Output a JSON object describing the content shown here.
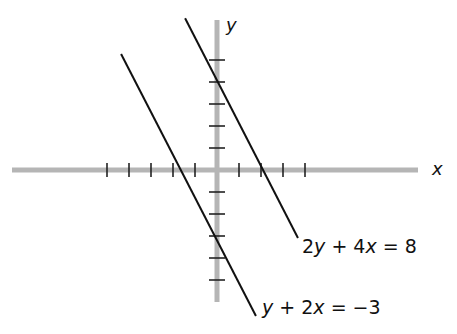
{
  "chart_data": {
    "type": "line",
    "title": "",
    "xlabel": "x",
    "ylabel": "y",
    "xlim": [
      -9.3,
      9.2
    ],
    "ylim": [
      -6.0,
      6.8
    ],
    "grid": false,
    "x_ticks": [
      -5,
      -4,
      -3,
      -2,
      -1,
      1,
      2,
      3,
      4
    ],
    "y_ticks": [
      -5,
      -4,
      -3,
      -2,
      -1,
      1,
      2,
      3,
      4,
      5
    ],
    "series": [
      {
        "name": "2y + 4x = 8",
        "equation": "y = 4 - 2x",
        "x": [
          -1.45,
          3.68
        ],
        "y": [
          6.9,
          -3.09
        ],
        "y_intercept": 4,
        "x_intercept": 2
      },
      {
        "name": "y + 2x = -3",
        "equation": "y = -3 - 2x",
        "x": [
          -4.36,
          1.77
        ],
        "y": [
          5.27,
          -6.64
        ],
        "y_intercept": -3,
        "x_intercept": -1.5
      }
    ],
    "annotations": [
      "2y + 4x = 8",
      "y + 2x = −3"
    ]
  },
  "layout": {
    "origin_px": [
      217,
      170
    ],
    "unit_px": 22,
    "x_axis_px": [
      12,
      418
    ],
    "y_axis_px": [
      20,
      302
    ],
    "axis_color": "#b5b5b5",
    "line_color": "#111111"
  },
  "labels": {
    "x_axis": "x",
    "y_axis": "y",
    "eq1": {
      "parts": [
        "2",
        "y",
        " + 4",
        "x",
        " = 8"
      ]
    },
    "eq2": {
      "parts": [
        "y",
        " + 2",
        "x",
        " = −3"
      ]
    }
  }
}
